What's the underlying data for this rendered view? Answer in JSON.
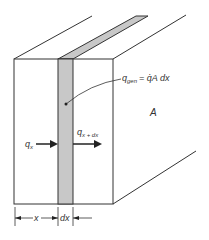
{
  "diagram": {
    "labels": {
      "q_gen": "q",
      "q_gen_sub": "gen",
      "q_gen_eq": "= q̇A dx",
      "area": "A",
      "q_x": "q",
      "q_x_sub": "x",
      "q_x_dx": "q",
      "q_x_dx_sub": "x + dx",
      "dim_x": "x",
      "dim_dx": "dx"
    },
    "colors": {
      "line": "#333333",
      "strip_fill": "#c8c8c8",
      "background": "#ffffff"
    }
  }
}
